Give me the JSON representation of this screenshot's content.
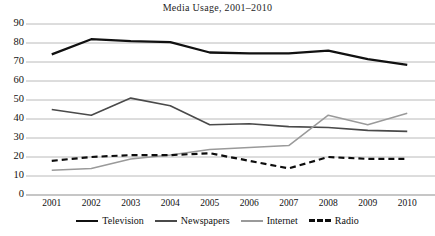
{
  "chart_data": {
    "type": "line",
    "title": "Media  Usage, 2001–2010",
    "xlabel": "",
    "ylabel": "",
    "x": [
      "2001",
      "2002",
      "2003",
      "2004",
      "2005",
      "2006",
      "2007",
      "2008",
      "2009",
      "2010"
    ],
    "categories": [
      "2001",
      "2002",
      "2003",
      "2004",
      "2005",
      "2006",
      "2007",
      "2008",
      "2009",
      "2010"
    ],
    "ylim": [
      0,
      90
    ],
    "yticks": [
      0,
      10,
      20,
      30,
      40,
      50,
      60,
      70,
      80,
      90
    ],
    "ytick_labels": [
      "0",
      "10",
      "20",
      "30",
      "40",
      "50",
      "60",
      "70",
      "80",
      "90"
    ],
    "grid": true,
    "grid_axis": "y",
    "legend_position": "bottom",
    "series": [
      {
        "name": "Television",
        "values": [
          74,
          82,
          81,
          80.5,
          75,
          74.5,
          74.5,
          76,
          71.5,
          68.5
        ],
        "color": "#111111",
        "width": 2.3,
        "style": "solid"
      },
      {
        "name": "Newspapers",
        "values": [
          45,
          42,
          51,
          47,
          37,
          37.5,
          36,
          35.5,
          34,
          33.5
        ],
        "color": "#4a4a4a",
        "width": 1.6,
        "style": "solid"
      },
      {
        "name": "Internet",
        "values": [
          13,
          14,
          19,
          21,
          24,
          25,
          26,
          42,
          37,
          43
        ],
        "color": "#9a9a9a",
        "width": 1.5,
        "style": "solid"
      },
      {
        "name": "Radio",
        "values": [
          18,
          20,
          21,
          21,
          22,
          18,
          14,
          20,
          19,
          19
        ],
        "color": "#0d0d0d",
        "width": 2.2,
        "style": "dashed"
      }
    ]
  },
  "legend": {
    "items": [
      {
        "label": "Television"
      },
      {
        "label": "Newspapers"
      },
      {
        "label": "Internet"
      },
      {
        "label": "Radio"
      }
    ]
  }
}
